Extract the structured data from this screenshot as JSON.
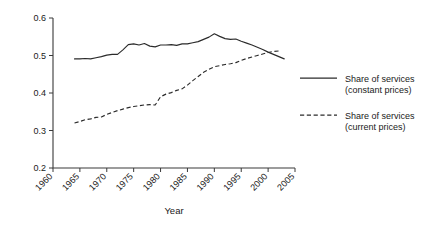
{
  "chart_data": {
    "type": "line",
    "title": "",
    "xlabel": "Year",
    "ylabel": "",
    "xlim": [
      1960,
      2005
    ],
    "ylim": [
      0.2,
      0.6
    ],
    "grid": false,
    "legend_position": "right",
    "xticks": [
      1960,
      1965,
      1970,
      1975,
      1980,
      1985,
      1990,
      1995,
      2000,
      2005
    ],
    "xtick_labels": [
      "1960",
      "1965",
      "1970",
      "1975",
      "1980",
      "1985",
      "1990",
      "1995",
      "2000",
      "2005"
    ],
    "yticks": [
      0.2,
      0.3,
      0.4,
      0.5,
      0.6
    ],
    "ytick_labels": [
      "0.2",
      "0.3",
      "0.4",
      "0.5",
      "0.6"
    ],
    "x": [
      1964,
      1965,
      1966,
      1967,
      1968,
      1969,
      1970,
      1971,
      1972,
      1973,
      1974,
      1975,
      1976,
      1977,
      1978,
      1979,
      1980,
      1981,
      1982,
      1983,
      1984,
      1985,
      1986,
      1987,
      1988,
      1989,
      1990,
      1991,
      1992,
      1993,
      1994,
      1995,
      1996,
      1997,
      1998,
      1999,
      2000,
      2001,
      2002,
      2003
    ],
    "series": [
      {
        "name": "Share of services (constant prices)",
        "style": "solid",
        "color": "#2b2b2b",
        "values": [
          0.491,
          0.491,
          0.492,
          0.491,
          0.494,
          0.497,
          0.501,
          0.503,
          0.503,
          0.515,
          0.529,
          0.531,
          0.528,
          0.532,
          0.525,
          0.523,
          0.528,
          0.528,
          0.529,
          0.527,
          0.531,
          0.531,
          0.534,
          0.537,
          0.543,
          0.549,
          0.558,
          0.551,
          0.545,
          0.543,
          0.544,
          0.538,
          0.533,
          0.528,
          0.522,
          0.516,
          0.509,
          0.503,
          0.497,
          0.491
        ]
      },
      {
        "name": "Share of services (current prices)",
        "style": "dashed",
        "color": "#2b2b2b",
        "values": [
          0.32,
          0.324,
          0.329,
          0.331,
          0.335,
          0.336,
          0.343,
          0.348,
          0.353,
          0.357,
          0.361,
          0.364,
          0.366,
          0.368,
          0.369,
          0.368,
          0.39,
          0.397,
          0.401,
          0.407,
          0.411,
          0.421,
          0.433,
          0.444,
          0.455,
          0.463,
          0.47,
          0.473,
          0.476,
          0.478,
          0.481,
          0.487,
          0.492,
          0.496,
          0.5,
          0.504,
          0.508,
          0.511,
          0.512,
          null
        ]
      }
    ],
    "legend": [
      {
        "label_line1": "Share of services",
        "label_line2": "(constant prices)",
        "style": "solid"
      },
      {
        "label_line1": "Share of services",
        "label_line2": "(current prices)",
        "style": "dashed"
      }
    ]
  }
}
